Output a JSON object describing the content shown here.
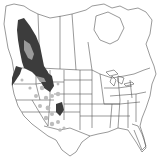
{
  "map": {
    "type": "range-map",
    "region": "North America (Canada, USA, northern Mexico)",
    "background_color": "#ffffff",
    "border_color": "#555555",
    "legend": [],
    "range_classes": [
      {
        "name": "primary-range",
        "color": "#3c3c3c"
      },
      {
        "name": "secondary-range",
        "color": "#9a9a9a"
      },
      {
        "name": "isolated-populations",
        "color": "#bdbdbd"
      }
    ]
  }
}
